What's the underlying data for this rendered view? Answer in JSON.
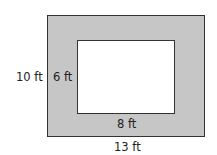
{
  "figure": {
    "outer_rectangle": {
      "width_label": "13 ft",
      "height_label": "10 ft",
      "fill": "#c6c6c6"
    },
    "inner_rectangle": {
      "width_label": "8 ft",
      "height_label": "6 ft",
      "fill": "#ffffff"
    },
    "stroke": "#333333"
  }
}
